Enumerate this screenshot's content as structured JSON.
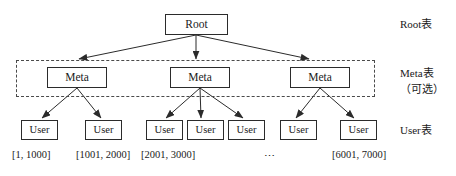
{
  "diagram": {
    "background_color": "#ffffff",
    "stroke_color": "#2b2b2b",
    "dashed_stroke_color": "#4a4a4a"
  },
  "nodes": {
    "root": {
      "label": "Root",
      "x": 165,
      "y": 14,
      "w": 63,
      "h": 21
    },
    "meta": [
      {
        "label": "Meta",
        "x": 47,
        "y": 67,
        "w": 60,
        "h": 21
      },
      {
        "label": "Meta",
        "x": 170,
        "y": 67,
        "w": 60,
        "h": 21
      },
      {
        "label": "Meta",
        "x": 290,
        "y": 67,
        "w": 60,
        "h": 21
      }
    ],
    "user": [
      {
        "label": "User",
        "x": 21,
        "y": 120,
        "w": 37,
        "h": 20
      },
      {
        "label": "User",
        "x": 85,
        "y": 120,
        "w": 37,
        "h": 20
      },
      {
        "label": "User",
        "x": 146,
        "y": 120,
        "w": 37,
        "h": 20
      },
      {
        "label": "User",
        "x": 187,
        "y": 120,
        "w": 37,
        "h": 20
      },
      {
        "label": "User",
        "x": 228,
        "y": 120,
        "w": 37,
        "h": 20
      },
      {
        "label": "User",
        "x": 280,
        "y": 120,
        "w": 37,
        "h": 20
      },
      {
        "label": "User",
        "x": 340,
        "y": 120,
        "w": 37,
        "h": 20
      }
    ]
  },
  "meta_group_box": {
    "x": 16,
    "y": 60,
    "w": 359,
    "h": 37,
    "style": "dashed"
  },
  "range_labels": [
    {
      "text": "[1, 1000]",
      "x": 12,
      "y": 150
    },
    {
      "text": "[1001, 2000]",
      "x": 76,
      "y": 150
    },
    {
      "text": "[2001, 3000]",
      "x": 141,
      "y": 150
    },
    {
      "text": "[6001, 7000]",
      "x": 332,
      "y": 150
    }
  ],
  "ellipsis": {
    "text": "⋯",
    "x": 264,
    "y": 151
  },
  "side_labels": [
    {
      "id": "root-table",
      "lines": "Root表",
      "x": 400,
      "y": 18
    },
    {
      "id": "meta-table",
      "lines": "Meta表\n（可选）",
      "x": 400,
      "y": 66
    },
    {
      "id": "user-table",
      "lines": "User表",
      "x": 400,
      "y": 124
    }
  ],
  "edges": {
    "root_to_meta": [
      {
        "from": [
          196,
          35
        ],
        "to": [
          79,
          59
        ]
      },
      {
        "from": [
          196,
          35
        ],
        "to": [
          196,
          59
        ]
      },
      {
        "from": [
          196,
          35
        ],
        "to": [
          309,
          59
        ]
      }
    ],
    "meta_to_user": [
      {
        "from": [
          77,
          88
        ],
        "to": [
          42,
          118
        ]
      },
      {
        "from": [
          77,
          88
        ],
        "to": [
          101,
          118
        ]
      },
      {
        "from": [
          200,
          88
        ],
        "to": [
          166,
          118
        ]
      },
      {
        "from": [
          200,
          88
        ],
        "to": [
          201,
          118
        ]
      },
      {
        "from": [
          200,
          88
        ],
        "to": [
          243,
          118
        ]
      },
      {
        "from": [
          320,
          88
        ],
        "to": [
          296,
          118
        ]
      },
      {
        "from": [
          320,
          88
        ],
        "to": [
          354,
          118
        ]
      }
    ]
  }
}
